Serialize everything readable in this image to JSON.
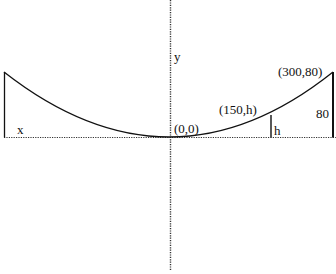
{
  "diagram": {
    "type": "parabolic-cable-cross-section",
    "labels": {
      "x_axis": "x",
      "y_axis": "y",
      "origin": "(0,0)",
      "midpoint": "(150,h)",
      "endpoint": "(300,80)",
      "mid_height": "h",
      "end_height": "80"
    },
    "colors": {
      "line": "#111111",
      "axis": "#333333",
      "background": "#ffffff"
    },
    "points": {
      "origin": [
        0,
        0
      ],
      "midpoint": [
        150,
        "h"
      ],
      "endpoint": [
        300,
        80
      ]
    }
  }
}
